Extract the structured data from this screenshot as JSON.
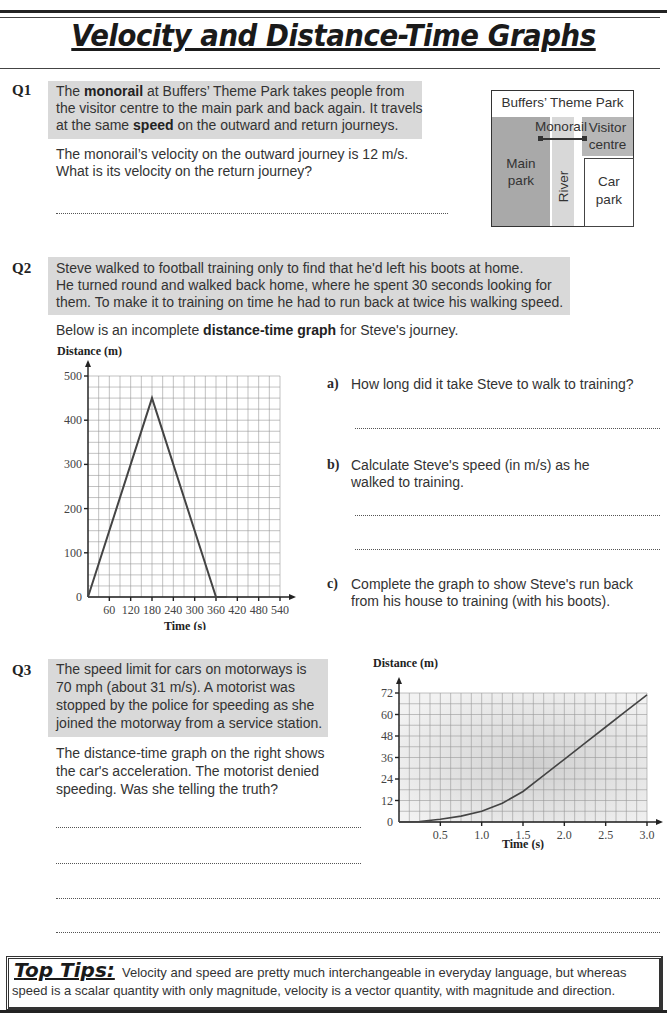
{
  "page": {
    "title": "Velocity and Distance-Time Graphs"
  },
  "q1": {
    "number": "Q1",
    "intro": {
      "pre": "The ",
      "bold1": "monorail",
      "mid1": " at Buffers’ Theme Park takes people from the visitor centre to the main park and back again.  It travels at the same ",
      "bold2": "speed",
      "post": " on the outward and return journeys."
    },
    "question_line1": "The monorail’s velocity on the outward journey is 12 m/s.",
    "question_line2": "What is its velocity on the return journey?",
    "map": {
      "title": "Buffers’ Theme Park",
      "monorail": "Monorail",
      "visitor_centre_line1": "Visitor",
      "visitor_centre_line2": "centre",
      "main_park_line1": "Main",
      "main_park_line2": "park",
      "river": "River",
      "car_park_line1": "Car",
      "car_park_line2": "park"
    }
  },
  "q2": {
    "number": "Q2",
    "intro_line1": "Steve walked to football training only to find that he'd left his boots at home.",
    "intro_line2": "He turned round and walked back home, where he spent 30 seconds looking for",
    "intro_line3": "them.  To make it to training on time he had to run back at twice his walking speed.",
    "graph_intro_pre": "Below is an incomplete ",
    "graph_intro_bold": "distance-time graph",
    "graph_intro_post": " for Steve's journey.",
    "parts": [
      {
        "label": "a)",
        "line1": "How long did it take Steve to walk to training?",
        "line2": ""
      },
      {
        "label": "b)",
        "line1": "Calculate Steve's speed (in m/s) as he",
        "line2": "walked to training."
      },
      {
        "label": "c)",
        "line1": "Complete the graph to show Steve's run back",
        "line2": "from his house to training (with his boots)."
      }
    ]
  },
  "q3": {
    "number": "Q3",
    "intro_line1": "The speed limit for cars on motorways is",
    "intro_line2": "70 mph (about 31 m/s).  A motorist was",
    "intro_line3": "stopped by the police for speeding as she",
    "intro_line4": "joined the motorway from a service station.",
    "q_line1": "The distance-time graph on the right shows",
    "q_line2": "the car's acceleration.  The motorist denied",
    "q_line3": "speeding.  Was she telling the truth?"
  },
  "tips": {
    "heading": "Top Tips:",
    "line1": "Velocity and speed are pretty much interchangeable in everyday language, but whereas",
    "line2": "speed is a scalar quantity with only magnitude, velocity is a vector quantity, with magnitude and direction."
  },
  "chart_data": [
    {
      "type": "line",
      "title": "Steve's journey (incomplete)",
      "xlabel": "Time (s)",
      "ylabel": "Distance (m)",
      "x_ticks": [
        60,
        120,
        180,
        240,
        300,
        360,
        420,
        480,
        540
      ],
      "y_ticks": [
        0,
        100,
        200,
        300,
        400,
        500
      ],
      "xlim": [
        0,
        540
      ],
      "ylim": [
        0,
        500
      ],
      "grid": true,
      "series": [
        {
          "name": "Steve",
          "x": [
            0,
            180,
            360,
            390
          ],
          "y": [
            0,
            450,
            0,
            0
          ]
        }
      ]
    },
    {
      "type": "line",
      "title": "Car acceleration",
      "xlabel": "Time (s)",
      "ylabel": "Distance (m)",
      "x_ticks": [
        0.5,
        1.0,
        1.5,
        2.0,
        2.5,
        3.0
      ],
      "y_ticks": [
        0,
        12,
        24,
        36,
        48,
        60,
        72
      ],
      "xlim": [
        0,
        3.0
      ],
      "ylim": [
        0,
        72
      ],
      "grid": true,
      "series": [
        {
          "name": "Car",
          "x": [
            0,
            0.25,
            0.5,
            0.75,
            1.0,
            1.25,
            1.5,
            1.75,
            2.0,
            2.25,
            2.5,
            2.75,
            3.0
          ],
          "y": [
            0,
            0.3,
            1.5,
            3.3,
            6,
            10.5,
            17,
            26,
            35,
            44,
            53,
            62,
            71
          ]
        }
      ]
    }
  ]
}
